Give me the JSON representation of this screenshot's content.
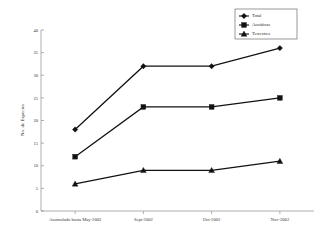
{
  "chart_data": {
    "type": "line",
    "title": "",
    "xlabel": "",
    "ylabel": "No. de Especies",
    "categories": [
      "Acumulado hasta May-2002",
      "Sept-2002",
      "Oct-2002",
      "Nov-2002"
    ],
    "ylim": [
      0,
      40
    ],
    "yticks": [
      0,
      5,
      10,
      15,
      20,
      25,
      30,
      35,
      40
    ],
    "grid": false,
    "legend_position": "top-right",
    "series": [
      {
        "name": "Total",
        "marker": "diamond",
        "color": "#111111",
        "values": [
          18,
          32,
          32,
          36
        ]
      },
      {
        "name": "Acuáticas",
        "marker": "square",
        "color": "#111111",
        "values": [
          12,
          23,
          23,
          25
        ]
      },
      {
        "name": "Terrestres",
        "marker": "triangle",
        "color": "#111111",
        "values": [
          6,
          9,
          9,
          11
        ]
      }
    ]
  },
  "axis": {
    "y_tick_labels": [
      "0",
      "5",
      "10",
      "15",
      "20",
      "25",
      "30",
      "35",
      "40"
    ],
    "y_title": "No. de Especies",
    "x_tick_labels": [
      "Acumulado hasta May-2002",
      "Sept-2002",
      "Oct-2002",
      "Nov-2002"
    ]
  },
  "legend": {
    "entries": [
      {
        "label": "Total"
      },
      {
        "label": "Acuáticas"
      },
      {
        "label": "Terrestres"
      }
    ]
  }
}
